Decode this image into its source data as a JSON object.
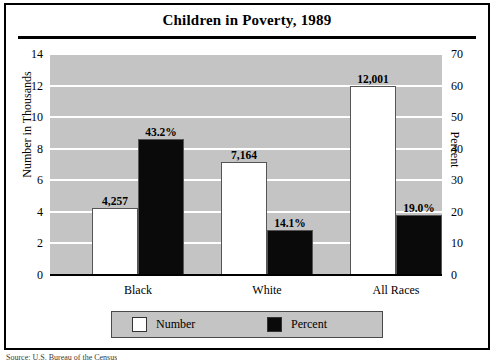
{
  "chart_data": {
    "type": "bar",
    "title": "Children in Poverty, 1989",
    "categories": [
      "Black",
      "White",
      "All Races"
    ],
    "series": [
      {
        "name": "Number",
        "axis": "left",
        "values": [
          4257,
          7164,
          12001
        ],
        "value_labels": [
          "4,257",
          "7,164",
          "12,001"
        ],
        "color": "#ffffff"
      },
      {
        "name": "Percent",
        "axis": "right",
        "values": [
          43.2,
          14.1,
          19.0
        ],
        "value_labels": [
          "43.2%",
          "14.1%",
          "19.0%"
        ],
        "color": "#0a0a0a"
      }
    ],
    "xlabel": "",
    "ylabel": "Number in Thousands",
    "ylabel_right": "Percent",
    "ylim": [
      0,
      14
    ],
    "ylim_right": [
      0,
      70
    ],
    "yticks": [
      "0",
      "2",
      "4",
      "6",
      "8",
      "10",
      "12",
      "14"
    ],
    "yticks_right": [
      "0",
      "10",
      "20",
      "30",
      "40",
      "50",
      "60",
      "70"
    ],
    "grid": true,
    "legend_position": "bottom",
    "plot_background": "#c4c4c4",
    "gridline_color": "#ffffff"
  },
  "legend": {
    "entries": [
      {
        "label": "Number",
        "color": "#ffffff"
      },
      {
        "label": "Percent",
        "color": "#0a0a0a"
      }
    ]
  },
  "footer": {
    "source": "Source: U.S. Bureau of the Census"
  }
}
